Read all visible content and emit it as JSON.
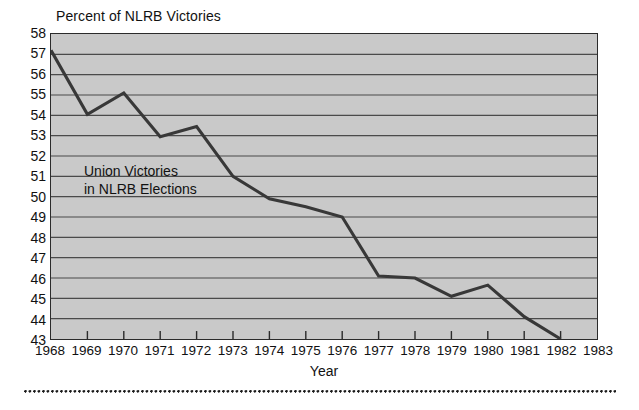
{
  "chart_data": {
    "type": "line",
    "title": "Percent of NLRB Victories",
    "xlabel": "Year",
    "ylabel": "",
    "annotation": [
      "Union Victories",
      "in NLRB Elections"
    ],
    "x": [
      1968,
      1969,
      1970,
      1971,
      1972,
      1973,
      1974,
      1975,
      1976,
      1977,
      1978,
      1979,
      1980,
      1981,
      1982
    ],
    "values": [
      57.2,
      54.05,
      55.1,
      52.95,
      53.45,
      51.0,
      49.9,
      49.5,
      49.0,
      46.1,
      46.0,
      45.1,
      45.65,
      44.1,
      43.0
    ],
    "series": [
      {
        "name": "Union Victories in NLRB Elections",
        "values": [
          57.2,
          54.05,
          55.1,
          52.95,
          53.45,
          51.0,
          49.9,
          49.5,
          49.0,
          46.1,
          46.0,
          45.1,
          45.65,
          44.1,
          43.0
        ]
      }
    ],
    "xtick_labels": [
      "1968",
      "1969",
      "1970",
      "1971",
      "1972",
      "1973",
      "1974",
      "1975",
      "1976",
      "1977",
      "1978",
      "1979",
      "1980",
      "1981",
      "1982",
      "1983"
    ],
    "xlim": [
      1968,
      1983
    ],
    "ylim": [
      43,
      58
    ],
    "ytick_labels": [
      "58",
      "57",
      "56",
      "55",
      "54",
      "53",
      "52",
      "51",
      "50",
      "49",
      "48",
      "47",
      "46",
      "45",
      "44",
      "43"
    ],
    "yticks": [
      58,
      57,
      56,
      55,
      54,
      53,
      52,
      51,
      50,
      49,
      48,
      47,
      46,
      45,
      44,
      43
    ],
    "grid": "horizontal",
    "legend": "none",
    "colors": {
      "plot_background": "#c9c9c9",
      "gridline": "#4a4a4a",
      "line": "#383838",
      "axis": "#2b2b2b",
      "text": "#111111",
      "page_background": "#ffffff"
    }
  }
}
